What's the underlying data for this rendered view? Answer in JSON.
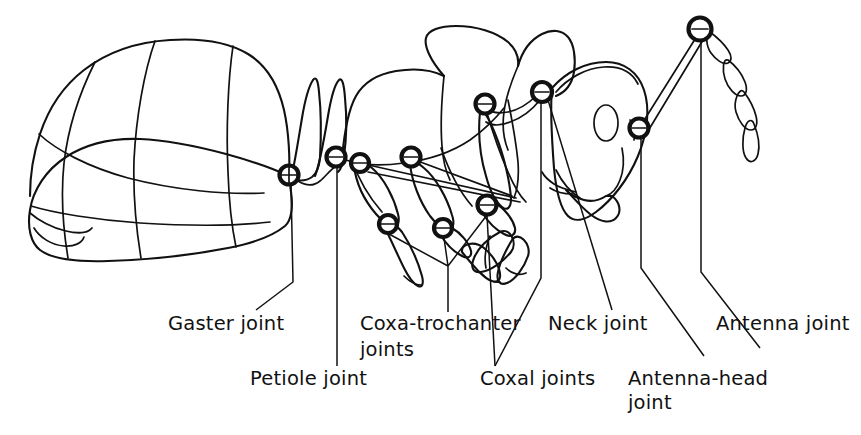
{
  "figure": {
    "kind": "anatomical-line-drawing",
    "background_color": "#ffffff",
    "ink_color": "#111111"
  },
  "labels": [
    {
      "id": "gaster-joint",
      "text": "Gaster joint",
      "x": 168,
      "y": 330
    },
    {
      "id": "petiole-joint",
      "text": "Petiole joint",
      "x": 250,
      "y": 385
    },
    {
      "id": "coxa-trochanter-joints",
      "text": "Coxa-trochanter",
      "x": 360,
      "y": 330
    },
    {
      "id": "coxa-trochanter-joints-line2",
      "text": "joints",
      "x": 360,
      "y": 356
    },
    {
      "id": "coxal-joints",
      "text": "Coxal joints",
      "x": 480,
      "y": 385
    },
    {
      "id": "neck-joint",
      "text": "Neck joint",
      "x": 548,
      "y": 330
    },
    {
      "id": "antenna-head-joint",
      "text": "Antenna-head",
      "x": 628,
      "y": 385
    },
    {
      "id": "antenna-head-joint-line2",
      "text": "joint",
      "x": 628,
      "y": 409
    },
    {
      "id": "antenna-joint",
      "text": "Antenna joint",
      "x": 716,
      "y": 330
    }
  ],
  "joints": [
    {
      "id": "gaster-joint",
      "cx": 289,
      "cy": 175,
      "r": 9.5
    },
    {
      "id": "petiole-joint",
      "cx": 336,
      "cy": 157,
      "r": 9.5
    },
    {
      "id": "coxal-joint-hind",
      "cx": 360,
      "cy": 163,
      "r": 9.0
    },
    {
      "id": "coxal-joint-mid",
      "cx": 411,
      "cy": 157,
      "r": 9.5
    },
    {
      "id": "coxal-joint-fore",
      "cx": 485,
      "cy": 104,
      "r": 9.5
    },
    {
      "id": "neck-joint",
      "cx": 542,
      "cy": 92,
      "r": 10.0
    },
    {
      "id": "coxa-trochanter-hind",
      "cx": 388,
      "cy": 224,
      "r": 9.0
    },
    {
      "id": "coxa-trochanter-mid",
      "cx": 443,
      "cy": 228,
      "r": 9.0
    },
    {
      "id": "coxa-trochanter-fore",
      "cx": 487,
      "cy": 205,
      "r": 9.5
    },
    {
      "id": "antenna-head-joint",
      "cx": 639,
      "cy": 128,
      "r": 9.5
    },
    {
      "id": "antenna-joint",
      "cx": 700,
      "cy": 29,
      "r": 11.5
    }
  ]
}
